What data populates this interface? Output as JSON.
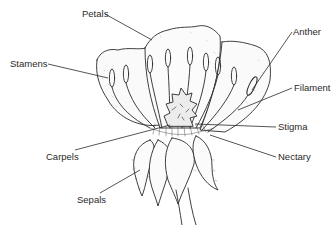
{
  "diagram": {
    "colors": {
      "ink": "#2a2a2a",
      "background": "#ffffff",
      "shade": "#bdbdbd"
    },
    "labels": [
      {
        "id": "petals",
        "text": "Petals",
        "x": 82,
        "y": 9,
        "line": [
          105,
          14,
          152,
          40
        ]
      },
      {
        "id": "stamens",
        "text": "Stamens",
        "x": 10,
        "y": 59,
        "line": [
          48,
          64,
          108,
          78
        ]
      },
      {
        "id": "anther",
        "text": "Anther",
        "x": 293,
        "y": 27,
        "line": [
          292,
          32,
          252,
          90
        ]
      },
      {
        "id": "filament",
        "text": "Filament",
        "x": 294,
        "y": 83,
        "line": [
          292,
          88,
          238,
          110
        ]
      },
      {
        "id": "stigma",
        "text": "Stigma",
        "x": 278,
        "y": 122,
        "line": [
          276,
          127,
          195,
          124
        ]
      },
      {
        "id": "nectary",
        "text": "Nectary",
        "x": 278,
        "y": 152,
        "line": [
          276,
          157,
          210,
          135
        ]
      },
      {
        "id": "carpels",
        "text": "Carpels",
        "x": 46,
        "y": 152,
        "line": [
          75,
          150,
          170,
          125
        ]
      },
      {
        "id": "sepals",
        "text": "Sepals",
        "x": 77,
        "y": 195,
        "line": [
          100,
          193,
          140,
          170
        ]
      }
    ]
  }
}
